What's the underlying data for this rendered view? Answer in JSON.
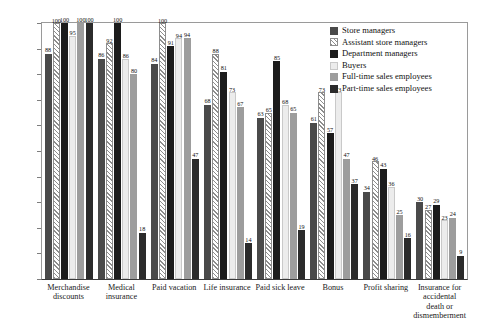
{
  "chart_data": {
    "type": "bar",
    "title": "",
    "xlabel": "",
    "ylabel": "",
    "ylim": [
      0,
      100
    ],
    "grid": false,
    "legend_position": "top-right",
    "ytick_labels": [
      "100%",
      "90%",
      "80%",
      "70%",
      "60%",
      "50%",
      "40%",
      "30%",
      "20%",
      "10%",
      "0%"
    ],
    "ytick_values": [
      100,
      90,
      80,
      70,
      60,
      50,
      40,
      30,
      20,
      10,
      0
    ],
    "categories": [
      "Merchandise discounts",
      "Medical insurance",
      "Paid vacation",
      "Life insurance",
      "Paid sick leave",
      "Bonus",
      "Profit sharing",
      "Insurance for accidental death or dismemberment"
    ],
    "series": [
      {
        "name": "Store managers",
        "color": "#4a4a4a",
        "pattern": "solid",
        "values": [
          88,
          86,
          84,
          68,
          63,
          61,
          34,
          30
        ]
      },
      {
        "name": "Assistant store managers",
        "color": "#8d8d8d",
        "pattern": "diagonal-hatch",
        "values": [
          100,
          92,
          100,
          88,
          65,
          73,
          46,
          27
        ]
      },
      {
        "name": "Department managers",
        "color": "#1c1c1c",
        "pattern": "solid",
        "values": [
          100,
          100,
          91,
          81,
          85,
          57,
          43,
          29
        ]
      },
      {
        "name": "Buyers",
        "color": "#ececec",
        "pattern": "solid",
        "values": [
          95,
          86,
          94,
          73,
          68,
          73,
          36,
          23
        ]
      },
      {
        "name": "Full-time sales employees",
        "color": "#9d9d9d",
        "pattern": "solid",
        "values": [
          100,
          80,
          94,
          67,
          65,
          47,
          25,
          24
        ]
      },
      {
        "name": "Part-time sales employees",
        "color": "#2b2b2b",
        "pattern": "solid",
        "values": [
          100,
          18,
          47,
          14,
          19,
          37,
          16,
          9
        ]
      }
    ]
  }
}
